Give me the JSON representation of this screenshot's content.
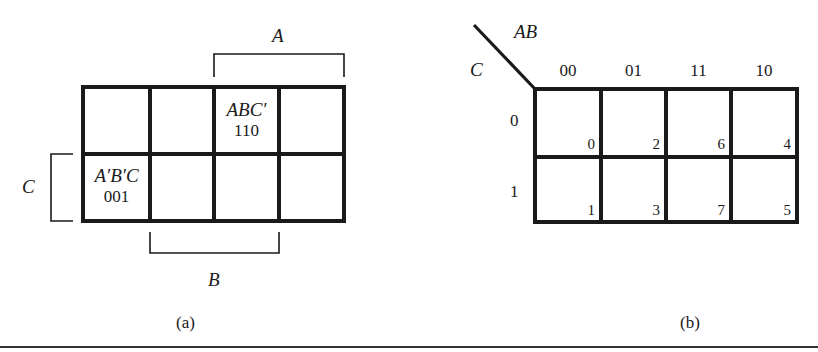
{
  "figure_a": {
    "caption": "(a)",
    "bracket_top_label": "A",
    "bracket_left_label": "C",
    "bracket_bottom_label": "B",
    "grid": {
      "rows": 2,
      "cols": 4
    },
    "cells": [
      {
        "row": 0,
        "col": 2,
        "term": "ABC′",
        "code": "110"
      },
      {
        "row": 1,
        "col": 0,
        "term": "A′B′C",
        "code": "001"
      }
    ]
  },
  "figure_b": {
    "caption": "(b)",
    "column_variable": "AB",
    "row_variable": "C",
    "column_headers": [
      "00",
      "01",
      "11",
      "10"
    ],
    "row_headers": [
      "0",
      "1"
    ],
    "cell_indices": [
      [
        "0",
        "2",
        "6",
        "4"
      ],
      [
        "1",
        "3",
        "7",
        "5"
      ]
    ]
  },
  "colors": {
    "ink": "#1a1a1a",
    "background": "#ffffff"
  }
}
